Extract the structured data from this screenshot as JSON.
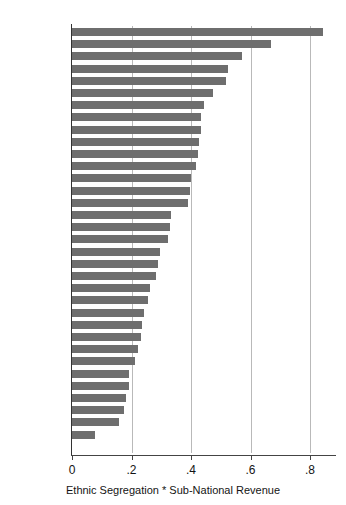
{
  "chart_data": {
    "type": "bar",
    "orientation": "horizontal",
    "title": "",
    "xlabel": "Ethnic Segregation * Sub-National Revenue",
    "ylabel": "",
    "xlim": [
      0,
      0.9
    ],
    "grid": true,
    "legend": null,
    "bar_color": "#6e6e6e",
    "xticks": [
      "0",
      ".2",
      ".4",
      ".6",
      ".8"
    ],
    "xtick_values": [
      0,
      0.2,
      0.4,
      0.6,
      0.8
    ],
    "categories": [
      "South Africa",
      "Canada",
      "Switzerland",
      "US",
      "India",
      "Taiwan",
      "Guatemala",
      "Belgium",
      "Czech Rep",
      "Spain",
      "Panama",
      "Australia",
      "Brazil",
      "Peru",
      "Bolivia",
      "Germany",
      "Paraguay",
      "Nicaragua",
      "Mexico",
      "UK",
      "El Salvador",
      "Dom Rep",
      "Chile",
      "Romania",
      "Hungary",
      "Uruguay",
      "Austria",
      "France",
      "Japan PR",
      "Japan  SMD",
      "Argentina",
      "Costa Rica",
      "Honduras",
      "Portugal"
    ],
    "values": [
      0.844,
      0.669,
      0.571,
      0.524,
      0.518,
      0.473,
      0.443,
      0.434,
      0.432,
      0.426,
      0.424,
      0.416,
      0.4,
      0.398,
      0.389,
      0.334,
      0.331,
      0.324,
      0.297,
      0.29,
      0.281,
      0.263,
      0.255,
      0.243,
      0.236,
      0.231,
      0.223,
      0.212,
      0.192,
      0.191,
      0.181,
      0.176,
      0.158,
      0.077
    ]
  }
}
